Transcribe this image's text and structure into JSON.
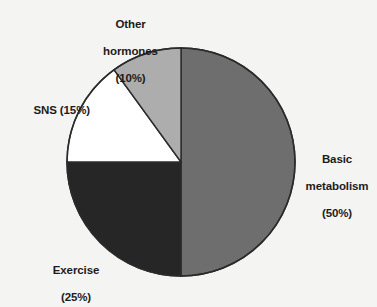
{
  "figure": {
    "background_color": "#f4f4f2",
    "outline_color": "#2b2b2b"
  },
  "chart_data": {
    "type": "pie",
    "title": "",
    "subtitle": "",
    "xlabel": "",
    "ylabel": "",
    "legend_position": "none",
    "grid": false,
    "units": "percent",
    "total": 100,
    "start_angle_deg": 0,
    "direction": "clockwise",
    "categories": [
      "Basic metabolism",
      "Exercise",
      "SNS",
      "Other hormones"
    ],
    "values": [
      50,
      25,
      15,
      10
    ],
    "colors": [
      "#6e6e6e",
      "#262626",
      "#ffffff",
      "#adadad"
    ],
    "slices": [
      {
        "name": "Basic metabolism",
        "value": 50,
        "percent_text": "(50%)",
        "color": "#6e6e6e",
        "start_deg": 0,
        "end_deg": 180,
        "label_lines": [
          "Basic",
          "metabolism",
          "(50%)"
        ]
      },
      {
        "name": "Exercise",
        "value": 25,
        "percent_text": "(25%)",
        "color": "#262626",
        "start_deg": 180,
        "end_deg": 270,
        "label_lines": [
          "Exercise",
          "(25%)"
        ]
      },
      {
        "name": "SNS",
        "value": 15,
        "percent_text": "(15%)",
        "color": "#ffffff",
        "start_deg": 270,
        "end_deg": 324,
        "label_lines": [
          "SNS (15%)"
        ]
      },
      {
        "name": "Other hormones",
        "value": 10,
        "percent_text": "(10%)",
        "color": "#adadad",
        "start_deg": 324,
        "end_deg": 360,
        "label_lines": [
          "Other",
          "hormones",
          "(10%)"
        ]
      }
    ]
  },
  "labels": {
    "other_hormones": {
      "line1": "Other",
      "line2": "hormones",
      "line3": "(10%)"
    },
    "sns": {
      "name": "SNS",
      "percent": "(15%)",
      "full": "SNS (15%)"
    },
    "basic_metabolism": {
      "line1": "Basic",
      "line2": "metabolism",
      "line3": "(50%)"
    },
    "exercise": {
      "line1": "Exercise",
      "line2": "(25%)"
    }
  }
}
